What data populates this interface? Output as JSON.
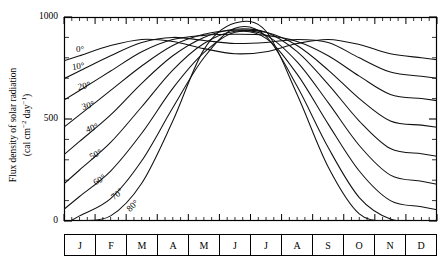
{
  "chart_data": {
    "type": "line",
    "title": "",
    "xlabel": "",
    "ylabel_line1": "Flux density of solar radiation",
    "ylabel_line2_pre": "(cal cm",
    "ylabel_line2_sup1": "−2",
    "ylabel_line2_mid": " day",
    "ylabel_line2_sup2": "−1",
    "ylabel_line2_post": ")",
    "ylim": [
      0,
      1000
    ],
    "ytick_values": [
      0,
      500,
      1000
    ],
    "ytick_labels": [
      "0",
      "500",
      "1000"
    ],
    "grid": false,
    "legend_position": "inline-curve-labels",
    "categories": [
      "J",
      "F",
      "M",
      "A",
      "M",
      "J",
      "J",
      "A",
      "S",
      "O",
      "N",
      "D"
    ],
    "x": [
      0.5,
      1.5,
      2.5,
      3.5,
      4.5,
      5.5,
      6.5,
      7.5,
      8.5,
      9.5,
      10.5,
      11.5
    ],
    "series": [
      {
        "name": "0°",
        "label": "0°",
        "values": [
          810,
          860,
          890,
          880,
          845,
          820,
          830,
          870,
          890,
          865,
          820,
          800
        ]
      },
      {
        "name": "10°",
        "label": "10°",
        "values": [
          735,
          810,
          875,
          900,
          885,
          870,
          875,
          890,
          875,
          800,
          730,
          710
        ]
      },
      {
        "name": "20°",
        "label": "20°",
        "values": [
          640,
          735,
          830,
          890,
          910,
          915,
          910,
          880,
          810,
          710,
          620,
          600
        ]
      },
      {
        "name": "30°",
        "label": "30°",
        "values": [
          520,
          640,
          760,
          860,
          915,
          935,
          925,
          860,
          740,
          600,
          490,
          470
        ]
      },
      {
        "name": "40°",
        "label": "40°",
        "values": [
          390,
          520,
          675,
          810,
          900,
          940,
          925,
          830,
          670,
          490,
          355,
          330
        ]
      },
      {
        "name": "50°",
        "label": "50°",
        "values": [
          250,
          385,
          560,
          740,
          870,
          930,
          910,
          780,
          580,
          370,
          225,
          195
        ]
      },
      {
        "name": "60°",
        "label": "60°",
        "values": [
          120,
          245,
          430,
          650,
          825,
          925,
          895,
          720,
          475,
          245,
          100,
          70
        ]
      },
      {
        "name": "70°",
        "label": "70°",
        "values": [
          25,
          110,
          295,
          555,
          800,
          945,
          905,
          660,
          360,
          115,
          10,
          0
        ]
      },
      {
        "name": "80°",
        "label": "80°",
        "values": [
          0,
          25,
          185,
          490,
          840,
          970,
          930,
          620,
          265,
          35,
          0,
          0
        ]
      }
    ],
    "latitude_labels": [
      {
        "text": "0°",
        "x": 76,
        "y": 44,
        "rotate": 0
      },
      {
        "text": "10°",
        "x": 72,
        "y": 62,
        "rotate": -8
      },
      {
        "text": "20°",
        "x": 78,
        "y": 82,
        "rotate": -12
      },
      {
        "text": "30°",
        "x": 82,
        "y": 102,
        "rotate": -16
      },
      {
        "text": "40°",
        "x": 86,
        "y": 125,
        "rotate": -20
      },
      {
        "text": "50°",
        "x": 90,
        "y": 152,
        "rotate": -26
      },
      {
        "text": "60°",
        "x": 94,
        "y": 178,
        "rotate": -32
      },
      {
        "text": "70°",
        "x": 112,
        "y": 193,
        "rotate": -40
      },
      {
        "text": "80°",
        "x": 128,
        "y": 205,
        "rotate": -44
      }
    ]
  },
  "axes": {
    "plot_left": 64,
    "plot_right": 437,
    "plot_top": 17,
    "plot_bottom": 221,
    "months_strip_top": 234,
    "months_strip_height": 22
  },
  "colors": {
    "background": "#ffffff",
    "ink": "#000000",
    "curve": "#111111"
  }
}
